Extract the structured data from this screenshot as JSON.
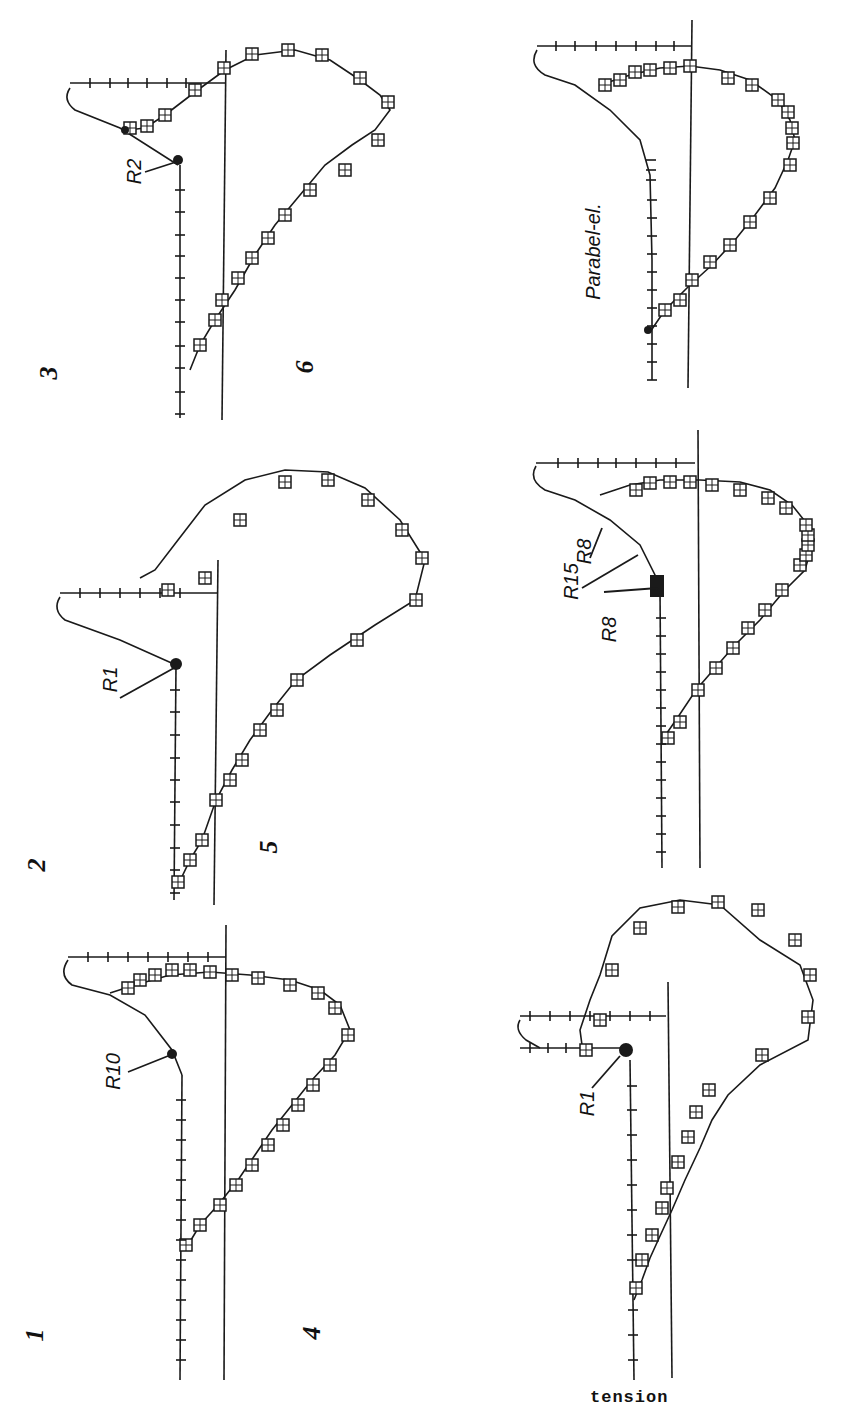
{
  "figure": {
    "orientation": "rotated 90 degrees counter-clockwise",
    "panels": [
      {
        "id": "1",
        "label": "1",
        "annotations": [
          "R10"
        ]
      },
      {
        "id": "2",
        "label": "2",
        "annotations": [
          "R1"
        ]
      },
      {
        "id": "3",
        "label": "3",
        "annotations": [
          "R2"
        ]
      },
      {
        "id": "4",
        "label": "4",
        "annotations": [
          "R1"
        ]
      },
      {
        "id": "5",
        "label": "5",
        "annotations": [
          "R15",
          "R8",
          "R8"
        ]
      },
      {
        "id": "6",
        "label": "6",
        "annotations": [
          "Parabel-el."
        ]
      }
    ],
    "caption_visible_fragment": "tension",
    "marker_legend": {
      "square_marker": "open square with inner cross",
      "tick_marker": "cross/tick marks along axis curve"
    }
  }
}
